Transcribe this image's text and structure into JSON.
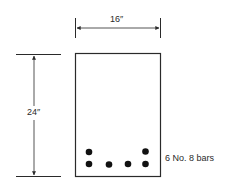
{
  "diagram": {
    "width_label": "16″",
    "height_label": "24″",
    "reinforcement_label": "6 No. 8 bars",
    "colors": {
      "line": "#2a2a2a",
      "bar": "#111111",
      "background": "#ffffff"
    },
    "reinforcement": {
      "count": 6,
      "bar_size": "No. 8",
      "rows": [
        {
          "row": "upper",
          "bars": 2
        },
        {
          "row": "lower",
          "bars": 4
        }
      ]
    }
  }
}
